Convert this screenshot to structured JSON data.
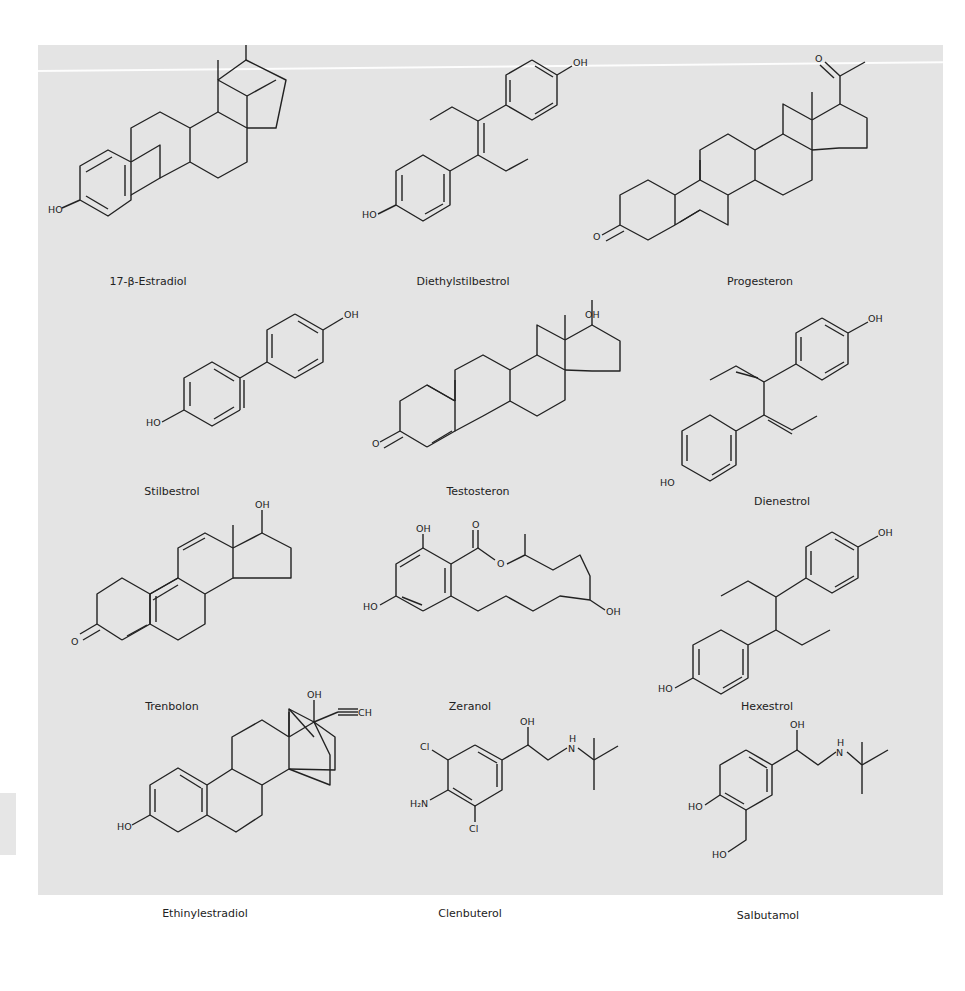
{
  "figure": {
    "compounds": [
      {
        "name": "17-β-Estradiol",
        "label_x": 148,
        "label_y": 230
      },
      {
        "name": "Diethylstilbestrol",
        "label_x": 463,
        "label_y": 230
      },
      {
        "name": "Progesteron",
        "label_x": 760,
        "label_y": 230
      },
      {
        "name": "Stilbestrol",
        "label_x": 172,
        "label_y": 450
      },
      {
        "name": "Testosteron",
        "label_x": 478,
        "label_y": 450
      },
      {
        "name": "Dienestrol",
        "label_x": 782,
        "label_y": 460
      },
      {
        "name": "Trenbolon",
        "label_x": 172,
        "label_y": 665
      },
      {
        "name": "Zeranol",
        "label_x": 470,
        "label_y": 665
      },
      {
        "name": "Hexestrol",
        "label_x": 767,
        "label_y": 665
      },
      {
        "name": "Ethinylestradiol",
        "label_x": 205,
        "label_y": 872
      },
      {
        "name": "Clenbuterol",
        "label_x": 470,
        "label_y": 872
      },
      {
        "name": "Salbutamol",
        "label_x": 768,
        "label_y": 874
      }
    ],
    "atom_labels": {
      "oh": "OH",
      "ho": "HO",
      "o": "O",
      "cl": "Cl",
      "h2n": "H₂N",
      "nh": "N",
      "h": "H",
      "ch": "CH"
    }
  }
}
